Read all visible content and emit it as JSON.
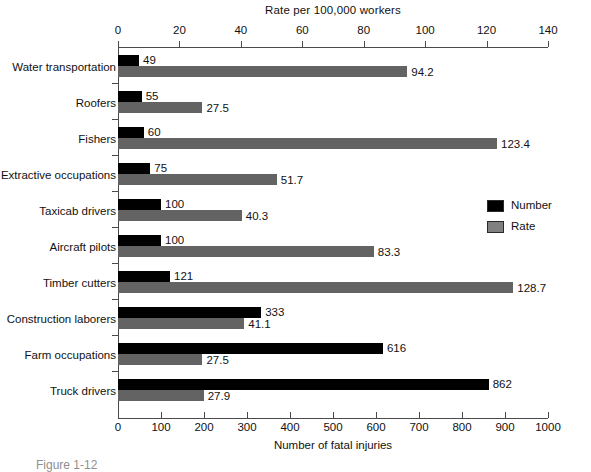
{
  "chart_data": {
    "type": "bar",
    "orientation": "horizontal",
    "title": "",
    "categories": [
      "Water transportation",
      "Roofers",
      "Fishers",
      "Extractive occupations",
      "Taxicab drivers",
      "Aircraft pilots",
      "Timber cutters",
      "Construction laborers",
      "Farm occupations",
      "Truck drivers"
    ],
    "series": [
      {
        "name": "Number",
        "axis": "bottom",
        "color": "#000000",
        "values": [
          49,
          55,
          60,
          75,
          100,
          100,
          121,
          333,
          616,
          862
        ],
        "labels": [
          "49",
          "55",
          "60",
          "75",
          "100",
          "100",
          "121",
          "333",
          "616",
          "862"
        ]
      },
      {
        "name": "Rate",
        "axis": "top",
        "color": "#636363",
        "values": [
          94.2,
          27.5,
          123.4,
          51.7,
          40.3,
          83.3,
          128.7,
          41.1,
          27.5,
          27.9
        ],
        "labels": [
          "94.2",
          "27.5",
          "123.4",
          "51.7",
          "40.3",
          "83.3",
          "128.7",
          "41.1",
          "27.5",
          "27.9"
        ]
      }
    ],
    "top_axis": {
      "label": "Rate per 100,000 workers",
      "ticks": [
        0,
        20,
        40,
        60,
        80,
        100,
        120,
        140
      ],
      "tick_labels": [
        "0",
        "20",
        "40",
        "60",
        "80",
        "100",
        "120",
        "140"
      ],
      "range": [
        0,
        140
      ]
    },
    "bottom_axis": {
      "label": "Number of fatal injuries",
      "ticks": [
        0,
        100,
        200,
        300,
        400,
        500,
        600,
        700,
        800,
        900,
        1000
      ],
      "tick_labels": [
        "0",
        "100",
        "200",
        "300",
        "400",
        "500",
        "600",
        "700",
        "800",
        "900",
        "1000"
      ],
      "range": [
        0,
        1000
      ]
    },
    "legend": {
      "position": "right",
      "entries": [
        {
          "label": "Number",
          "color": "#000000"
        },
        {
          "label": "Rate",
          "color": "#808080"
        }
      ]
    },
    "grid": false
  },
  "caption": "Figure 1-12",
  "colors": {
    "number": "#000000",
    "rate": "#636363",
    "axis": "#4a4a4a",
    "background": "#ffffff"
  }
}
